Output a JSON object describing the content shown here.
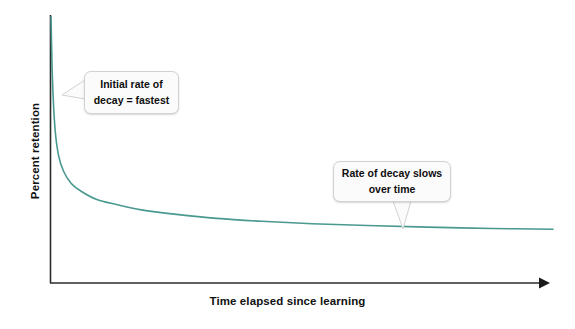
{
  "figure": {
    "background_color": "#ffffff",
    "width": 575,
    "height": 329
  },
  "chart_data": {
    "type": "line",
    "title": "",
    "subtitle": "",
    "xlabel": "Time elapsed since learning",
    "ylabel": "Percent retention",
    "grid": false,
    "legend": null,
    "axis_style": {
      "x_axis_arrow": true,
      "y_axis_arrow": false,
      "axis_color": "#2b2b2b",
      "tick_labels_x": [],
      "tick_labels_y": []
    },
    "series": [
      {
        "name": "Retention decay curve",
        "color": "#49998f",
        "line_width": 1.6,
        "x": [
          0,
          0.3,
          0.8,
          1.5,
          2.5,
          4,
          6,
          9,
          13,
          18,
          25,
          33,
          42,
          52,
          63,
          75,
          88,
          100
        ],
        "y": [
          100,
          76,
          58,
          48,
          42,
          37.5,
          34.5,
          31.5,
          29.5,
          27.5,
          25.8,
          24.3,
          23.2,
          22.3,
          21.6,
          21.0,
          20.5,
          20.2
        ],
        "xlim": [
          0,
          100
        ],
        "ylim": [
          0,
          100
        ]
      }
    ],
    "annotations": [
      {
        "id": "initial-decay",
        "text_line_1": "Initial rate of",
        "text_line_2": "decay = fastest",
        "points_to": "steep early portion of curve",
        "tail_direction": "left"
      },
      {
        "id": "decay-slows",
        "text_line_1": "Rate of decay slows",
        "text_line_2": "over time",
        "points_to": "flat late portion of curve",
        "tail_direction": "down"
      }
    ]
  },
  "annotations": {
    "initial_decay": {
      "line1": "Initial rate of",
      "line2": "decay = fastest"
    },
    "decay_slows": {
      "line1": "Rate of decay slows",
      "line2": "over time"
    }
  },
  "axes": {
    "x_label": "Time elapsed since learning",
    "y_label": "Percent retention"
  },
  "colors": {
    "curve": "#49998f",
    "axis": "#2b2b2b",
    "callout_background": "#fbfbfb",
    "callout_border": "#d2d2d2",
    "text": "#0e0e0e"
  }
}
